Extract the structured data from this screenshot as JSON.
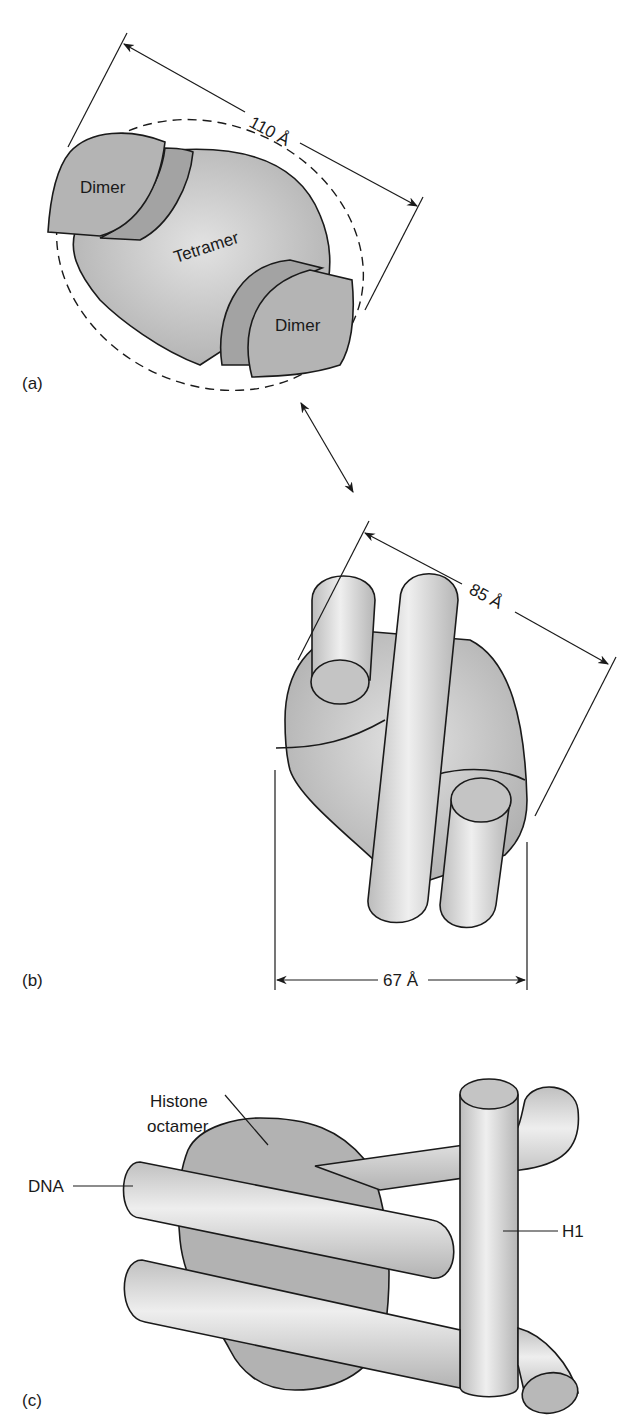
{
  "figure": {
    "panels": [
      {
        "id": "a",
        "tag": "(a)",
        "labels": {
          "dimer_top": "Dimer",
          "tetramer": "Tetramer",
          "dimer_bottom": "Dimer"
        },
        "dimension": "110 Å"
      },
      {
        "id": "b",
        "tag": "(b)",
        "dimension_diagonal": "85 Å",
        "dimension_width": "67 Å"
      },
      {
        "id": "c",
        "tag": "(c)",
        "labels": {
          "octamer_line1": "Histone",
          "octamer_line2": "octamer",
          "dna": "DNA",
          "h1": "H1"
        }
      }
    ],
    "colors": {
      "protein_fill": "#b8b8b8",
      "protein_band": "#a6a6a6",
      "cylinder_light": "#ececec",
      "cylinder_mid": "#c9c9c9",
      "outline": "#1a1a1a",
      "background": "#ffffff"
    }
  }
}
